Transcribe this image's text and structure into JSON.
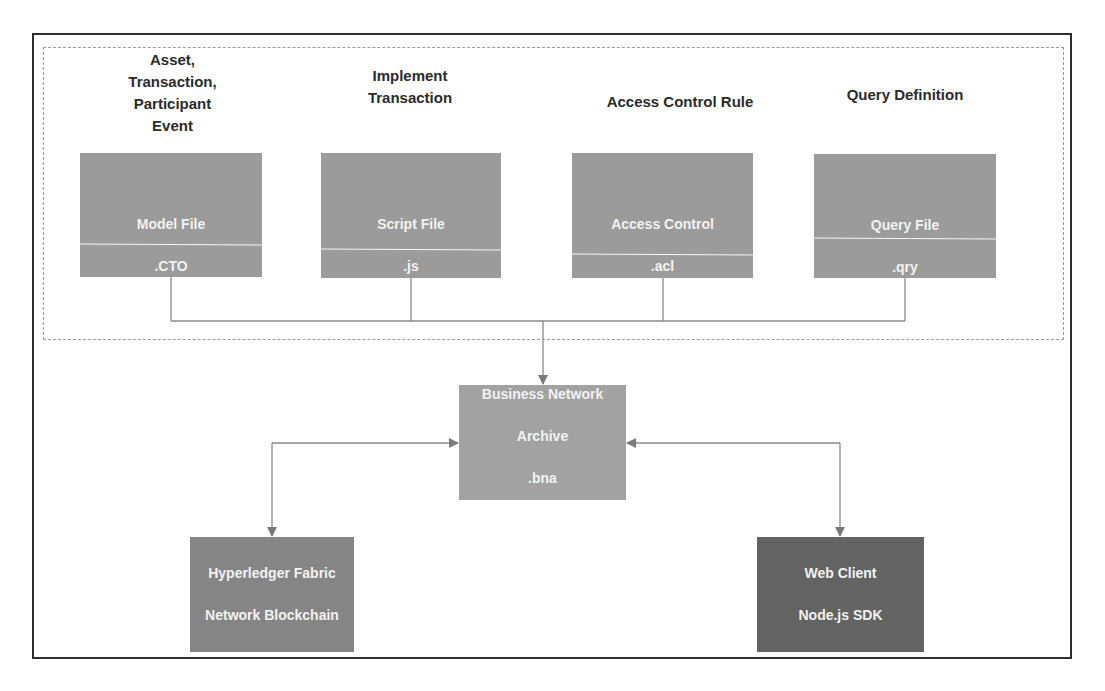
{
  "diagram": {
    "top_labels": [
      {
        "id": "model",
        "text": "Asset,\nTransaction,\nParticipant\nEvent"
      },
      {
        "id": "script",
        "text": "Implement\nTransaction"
      },
      {
        "id": "acl",
        "text": "Access Control Rule"
      },
      {
        "id": "query",
        "text": "Query Definition"
      }
    ],
    "file_boxes": [
      {
        "id": "model",
        "title": "Model File",
        "ext": ".CTO"
      },
      {
        "id": "script",
        "title": "Script File",
        "ext": ".js"
      },
      {
        "id": "acl",
        "title": "Access Control",
        "ext": ".acl"
      },
      {
        "id": "query",
        "title": "Query File",
        "ext": ".qry"
      }
    ],
    "archive": {
      "title": "Business Network",
      "subtitle": "Archive",
      "ext": ".bna"
    },
    "fabric": {
      "line1": "Hyperledger Fabric",
      "line2": "Network Blockchain"
    },
    "client": {
      "line1": "Web Client",
      "line2": "Node.js SDK"
    },
    "colors": {
      "file_box": "#9b9b9b",
      "archive_box": "#a2a2a2",
      "fabric_box": "#858585",
      "client_box": "#636363",
      "connector": "#8a8a8a",
      "border": "#2e2e2e"
    }
  }
}
